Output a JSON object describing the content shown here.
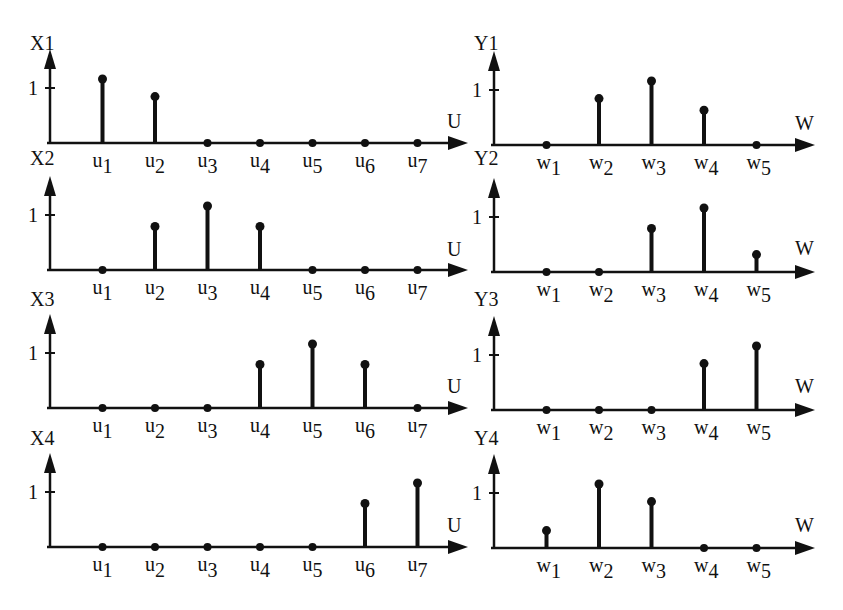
{
  "chart_data": [
    {
      "type": "stem",
      "title": "X1",
      "xlabel": "U",
      "ylabel": "X1",
      "ytick": "1",
      "categories": [
        "u1",
        "u2",
        "u3",
        "u4",
        "u5",
        "u6",
        "u7"
      ],
      "values": [
        1.0,
        0.8,
        0,
        0,
        0,
        0,
        0
      ],
      "ylim": [
        0,
        1.2
      ]
    },
    {
      "type": "stem",
      "title": "X2",
      "xlabel": "U",
      "ylabel": "X2",
      "ytick": "1",
      "categories": [
        "u1",
        "u2",
        "u3",
        "u4",
        "u5",
        "u6",
        "u7"
      ],
      "values": [
        0,
        0.75,
        1.0,
        0.75,
        0,
        0,
        0
      ],
      "ylim": [
        0,
        1.2
      ]
    },
    {
      "type": "stem",
      "title": "X3",
      "xlabel": "U",
      "ylabel": "X3",
      "ytick": "1",
      "categories": [
        "u1",
        "u2",
        "u3",
        "u4",
        "u5",
        "u6",
        "u7"
      ],
      "values": [
        0,
        0,
        0,
        0.75,
        1.0,
        0.75,
        0
      ],
      "ylim": [
        0,
        1.2
      ]
    },
    {
      "type": "stem",
      "title": "X4",
      "xlabel": "U",
      "ylabel": "X4",
      "ytick": "1",
      "categories": [
        "u1",
        "u2",
        "u3",
        "u4",
        "u5",
        "u6",
        "u7"
      ],
      "values": [
        0,
        0,
        0,
        0,
        0,
        0.75,
        1.0
      ],
      "ylim": [
        0,
        1.2
      ]
    },
    {
      "type": "stem",
      "title": "Y1",
      "xlabel": "W",
      "ylabel": "Y1",
      "ytick": "1",
      "categories": [
        "w1",
        "w2",
        "w3",
        "w4",
        "w5"
      ],
      "values": [
        0,
        0.8,
        1.0,
        0.6,
        0
      ],
      "ylim": [
        0,
        1.2
      ]
    },
    {
      "type": "stem",
      "title": "Y2",
      "xlabel": "W",
      "ylabel": "Y2",
      "ytick": "1",
      "categories": [
        "w1",
        "w2",
        "w3",
        "w4",
        "w5"
      ],
      "values": [
        0,
        0,
        0.75,
        1.0,
        0.3
      ],
      "ylim": [
        0,
        1.2
      ]
    },
    {
      "type": "stem",
      "title": "Y3",
      "xlabel": "W",
      "ylabel": "Y3",
      "ytick": "1",
      "categories": [
        "w1",
        "w2",
        "w3",
        "w4",
        "w5"
      ],
      "values": [
        0,
        0,
        0,
        0.8,
        1.0
      ],
      "ylim": [
        0,
        1.2
      ]
    },
    {
      "type": "stem",
      "title": "Y4",
      "xlabel": "W",
      "ylabel": "Y4",
      "ytick": "1",
      "categories": [
        "w1",
        "w2",
        "w3",
        "w4",
        "w5"
      ],
      "values": [
        0.3,
        1.0,
        0.8,
        0,
        0
      ],
      "ylim": [
        0,
        1.2
      ]
    }
  ],
  "layout": {
    "panels": [
      {
        "x0": 50,
        "base": 143,
        "unit": 58,
        "dx": 52.5,
        "xend": 468,
        "ylabel_y": 50,
        "xlabel_x": 447,
        "xlabel_y": 128
      },
      {
        "x0": 50,
        "base": 270,
        "unit": 58,
        "dx": 52.5,
        "xend": 468,
        "ylabel_y": 165,
        "xlabel_x": 447,
        "xlabel_y": 256
      },
      {
        "x0": 50,
        "base": 408,
        "unit": 58,
        "dx": 52.5,
        "xend": 468,
        "ylabel_y": 306,
        "xlabel_x": 447,
        "xlabel_y": 393
      },
      {
        "x0": 50,
        "base": 547,
        "unit": 58,
        "dx": 52.5,
        "xend": 468,
        "ylabel_y": 445,
        "xlabel_x": 447,
        "xlabel_y": 532
      },
      {
        "x0": 494,
        "base": 145,
        "unit": 58,
        "dx": 52.5,
        "xend": 815,
        "ylabel_y": 50,
        "xlabel_x": 795,
        "xlabel_y": 130
      },
      {
        "x0": 494,
        "base": 272,
        "unit": 58,
        "dx": 52.5,
        "xend": 815,
        "ylabel_y": 165,
        "xlabel_x": 795,
        "xlabel_y": 255
      },
      {
        "x0": 494,
        "base": 410,
        "unit": 58,
        "dx": 52.5,
        "xend": 815,
        "ylabel_y": 306,
        "xlabel_x": 795,
        "xlabel_y": 393
      },
      {
        "x0": 494,
        "base": 548,
        "unit": 58,
        "dx": 52.5,
        "xend": 815,
        "ylabel_y": 445,
        "xlabel_x": 795,
        "xlabel_y": 532
      }
    ],
    "ink": "#111111"
  }
}
